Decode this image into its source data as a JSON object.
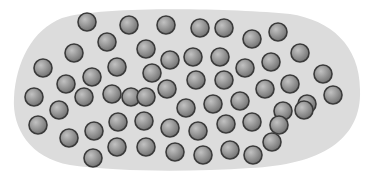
{
  "diagram": {
    "blob": {
      "fill": "#dcdcdc",
      "path": "M 62 18 C 100 6, 230 8, 290 14 C 330 20, 360 45, 360 90 C 362 140, 320 165, 250 168 C 190 172, 120 172, 70 165 C 30 158, 12 128, 14 98 C 16 62, 32 30, 62 18 Z"
    },
    "particle": {
      "radius": 9,
      "stroke": "#3a3a3a",
      "fill_light": "#c2c2c2",
      "fill_dark": "#6e6e6e"
    },
    "particles": [
      {
        "x": 87,
        "y": 22
      },
      {
        "x": 129,
        "y": 25
      },
      {
        "x": 166,
        "y": 25
      },
      {
        "x": 200,
        "y": 28
      },
      {
        "x": 224,
        "y": 28
      },
      {
        "x": 278,
        "y": 32
      },
      {
        "x": 107,
        "y": 42
      },
      {
        "x": 146,
        "y": 49
      },
      {
        "x": 252,
        "y": 39
      },
      {
        "x": 300,
        "y": 53
      },
      {
        "x": 74,
        "y": 53
      },
      {
        "x": 170,
        "y": 60
      },
      {
        "x": 193,
        "y": 57
      },
      {
        "x": 220,
        "y": 57
      },
      {
        "x": 245,
        "y": 68
      },
      {
        "x": 271,
        "y": 62
      },
      {
        "x": 43,
        "y": 68
      },
      {
        "x": 117,
        "y": 67
      },
      {
        "x": 152,
        "y": 73
      },
      {
        "x": 196,
        "y": 80
      },
      {
        "x": 224,
        "y": 80
      },
      {
        "x": 323,
        "y": 74
      },
      {
        "x": 66,
        "y": 84
      },
      {
        "x": 92,
        "y": 77
      },
      {
        "x": 131,
        "y": 97
      },
      {
        "x": 167,
        "y": 89
      },
      {
        "x": 265,
        "y": 89
      },
      {
        "x": 290,
        "y": 84
      },
      {
        "x": 34,
        "y": 97
      },
      {
        "x": 59,
        "y": 110
      },
      {
        "x": 84,
        "y": 97
      },
      {
        "x": 112,
        "y": 94
      },
      {
        "x": 146,
        "y": 97
      },
      {
        "x": 186,
        "y": 108
      },
      {
        "x": 213,
        "y": 104
      },
      {
        "x": 240,
        "y": 101
      },
      {
        "x": 283,
        "y": 111
      },
      {
        "x": 307,
        "y": 104
      },
      {
        "x": 333,
        "y": 95
      },
      {
        "x": 38,
        "y": 125
      },
      {
        "x": 69,
        "y": 138
      },
      {
        "x": 94,
        "y": 131
      },
      {
        "x": 118,
        "y": 122
      },
      {
        "x": 144,
        "y": 121
      },
      {
        "x": 170,
        "y": 128
      },
      {
        "x": 198,
        "y": 131
      },
      {
        "x": 226,
        "y": 124
      },
      {
        "x": 252,
        "y": 122
      },
      {
        "x": 279,
        "y": 125
      },
      {
        "x": 304,
        "y": 110
      },
      {
        "x": 93,
        "y": 158
      },
      {
        "x": 117,
        "y": 147
      },
      {
        "x": 146,
        "y": 147
      },
      {
        "x": 175,
        "y": 152
      },
      {
        "x": 203,
        "y": 155
      },
      {
        "x": 230,
        "y": 150
      },
      {
        "x": 253,
        "y": 155
      },
      {
        "x": 272,
        "y": 142
      }
    ]
  }
}
